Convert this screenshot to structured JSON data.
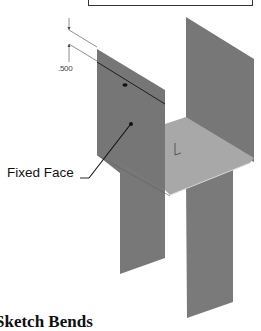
{
  "figure": {
    "dimension_label": ".500",
    "callout_label": "Fixed Face",
    "caption": "Sketch Bends",
    "colors": {
      "panel_dark": "#757575",
      "plate_light": "#a9a9a9",
      "line": "#222222",
      "background": "#ffffff"
    },
    "parts": [
      {
        "name": "left-flange",
        "description": "Front vertical flange (fixed face)"
      },
      {
        "name": "right-flange",
        "description": "Back vertical flange"
      },
      {
        "name": "base-plate",
        "description": "Horizontal base plate"
      }
    ]
  }
}
